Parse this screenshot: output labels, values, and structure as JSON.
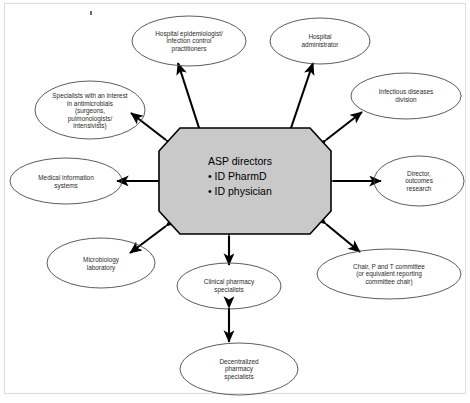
{
  "figure": {
    "type": "hub-and-spoke relationship diagram",
    "border_color": "#d9d9d9",
    "background": "#ffffff"
  },
  "center": {
    "name": "asp-directors-hub",
    "shape": "octagon",
    "fill_color": "#c9c9c9",
    "stroke_color": "#000000",
    "title": "ASP  directors",
    "bullets": [
      "ID PharmD",
      "ID physician"
    ],
    "text": "ASP  directors\n• ID PharmD\n• ID physician"
  },
  "nodes": [
    {
      "id": "hospital-epidemiologist",
      "label": "Hospital epidemiologist/\ninfection control\npractitioners",
      "shape": "ellipse",
      "position": "top-center-left"
    },
    {
      "id": "hospital-administrator",
      "label": "Hospital\nadministrator",
      "shape": "ellipse",
      "position": "top-center-right"
    },
    {
      "id": "infectious-diseases-division",
      "label": "Infectious diseases\ndivision",
      "shape": "ellipse",
      "position": "top-right"
    },
    {
      "id": "director-outcomes-research",
      "label": "Director,\noutcomes\nresearch",
      "shape": "ellipse",
      "position": "right"
    },
    {
      "id": "chair-p-and-t-committee",
      "label": "Chair, P and T committee\n(or equivalent reporting\ncommittee chair)",
      "shape": "ellipse",
      "position": "bottom-right"
    },
    {
      "id": "clinical-pharmacy-specialists",
      "label": "Clinical pharmacy\nspecialists",
      "shape": "ellipse",
      "position": "bottom-center"
    },
    {
      "id": "decentralized-pharmacy-specialists",
      "label": "Decentralized\npharmacy\nspecialists",
      "shape": "ellipse",
      "position": "bottom"
    },
    {
      "id": "microbiology-laboratory",
      "label": "Microbiology\nlaboratory",
      "shape": "ellipse",
      "position": "bottom-left"
    },
    {
      "id": "medical-information-systems",
      "label": "Medical information\nsystems",
      "shape": "ellipse",
      "position": "left"
    },
    {
      "id": "specialists-antimicrobials",
      "label": "Specialists with an interest\nin antimicrobials\n(surgeons,\npulmonologists/\nintensivists)",
      "shape": "ellipse",
      "position": "top-left"
    }
  ],
  "connectors": {
    "style": "double-headed arrow",
    "color": "#000000",
    "count": 10,
    "description": "Each ellipse is joined to the central ASP directors octagon by a bidirectional arrow."
  }
}
